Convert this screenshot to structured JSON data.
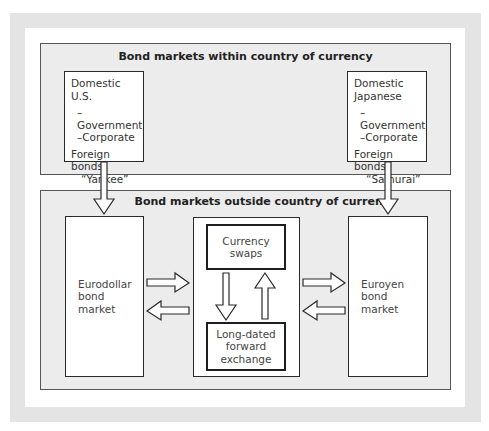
{
  "diagram": {
    "top_section": {
      "title": "Bond markets within country of currency",
      "us_box": {
        "heading": "Domestic U.S.",
        "items": [
          "–Government",
          "–Corporate"
        ],
        "foreign_line1": "Foreign",
        "foreign_line2": "bonds",
        "foreign_name": "“Yankee”"
      },
      "jp_box": {
        "heading_line1": "Domestic",
        "heading_line2": "Japanese",
        "items": [
          "–Government",
          "–Corporate"
        ],
        "foreign_line1": "Foreign bonds",
        "foreign_name": "“Samurai”"
      }
    },
    "bottom_section": {
      "title": "Bond markets outside country of currency",
      "eurodollar": {
        "line1": "Eurodollar",
        "line2": "bond market"
      },
      "euroyen": {
        "line1": "Euroyen",
        "line2": "bond market"
      },
      "currency_swaps": {
        "line1": "Currency",
        "line2": "swaps"
      },
      "forward_exchange": {
        "line1": "Long-dated",
        "line2": "forward",
        "line3": "exchange"
      }
    },
    "arrows": [
      {
        "from": "Domestic U.S.",
        "to": "Eurodollar bond market",
        "direction": "down"
      },
      {
        "from": "Domestic Japanese",
        "to": "Euroyen bond market",
        "direction": "down"
      },
      {
        "from": "Eurodollar bond market",
        "to": "Center (swaps/forward)",
        "direction": "right"
      },
      {
        "from": "Center (swaps/forward)",
        "to": "Eurodollar bond market",
        "direction": "left"
      },
      {
        "from": "Center (swaps/forward)",
        "to": "Euroyen bond market",
        "direction": "right"
      },
      {
        "from": "Euroyen bond market",
        "to": "Center (swaps/forward)",
        "direction": "left"
      },
      {
        "from": "Currency swaps",
        "to": "Long-dated forward exchange",
        "direction": "down"
      },
      {
        "from": "Long-dated forward exchange",
        "to": "Currency swaps",
        "direction": "up"
      }
    ],
    "colors": {
      "frame_grey": "#e4e4e4",
      "section_grey": "#ececec",
      "box_fill": "#ffffff",
      "line": "#2a2a2a"
    }
  }
}
